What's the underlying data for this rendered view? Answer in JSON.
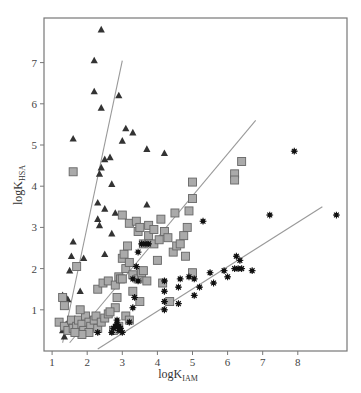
{
  "chart_data": {
    "type": "scatter",
    "title": "",
    "xlabel": "logK_IAM",
    "xlabel_main": "logK",
    "xlabel_sub": "IAM",
    "ylabel": "logK_HSA",
    "ylabel_main": "logK",
    "ylabel_sub": "HSA",
    "xlim": [
      0.5,
      9.4
    ],
    "ylim": [
      0,
      8.0
    ],
    "xticks": [
      1,
      2,
      3,
      4,
      5,
      6,
      7,
      8
    ],
    "yticks": [
      1,
      2,
      3,
      4,
      5,
      6,
      7
    ],
    "grid": false,
    "legend": null,
    "series": [
      {
        "name": "triangles",
        "marker": "triangle",
        "color": "#333333",
        "points": [
          [
            2.4,
            7.8
          ],
          [
            2.2,
            7.05
          ],
          [
            2.2,
            6.3
          ],
          [
            2.4,
            5.9
          ],
          [
            2.9,
            6.2
          ],
          [
            3.1,
            5.4
          ],
          [
            3.3,
            5.3
          ],
          [
            3.0,
            5.1
          ],
          [
            1.6,
            5.15
          ],
          [
            2.5,
            4.65
          ],
          [
            2.65,
            4.7
          ],
          [
            2.4,
            4.45
          ],
          [
            2.35,
            4.3
          ],
          [
            3.7,
            4.9
          ],
          [
            4.2,
            4.8
          ],
          [
            2.7,
            4.05
          ],
          [
            2.3,
            3.6
          ],
          [
            2.5,
            3.45
          ],
          [
            2.8,
            3.35
          ],
          [
            3.7,
            3.55
          ],
          [
            2.3,
            3.2
          ],
          [
            2.35,
            3.05
          ],
          [
            2.7,
            2.85
          ],
          [
            1.6,
            2.65
          ],
          [
            2.5,
            2.35
          ],
          [
            1.55,
            2.3
          ],
          [
            1.9,
            2.25
          ],
          [
            1.5,
            1.95
          ],
          [
            1.3,
            1.35
          ],
          [
            1.4,
            1.3
          ],
          [
            1.45,
            1.25
          ],
          [
            1.8,
            1.45
          ],
          [
            1.5,
            0.75
          ],
          [
            1.4,
            0.65
          ],
          [
            1.7,
            0.7
          ],
          [
            1.3,
            0.5
          ],
          [
            1.35,
            0.35
          ],
          [
            2.1,
            0.75
          ],
          [
            1.45,
            0.55
          ]
        ]
      },
      {
        "name": "squares",
        "marker": "square",
        "color": "#aaaaaa",
        "points": [
          [
            1.6,
            4.35
          ],
          [
            1.7,
            2.05
          ],
          [
            1.3,
            1.3
          ],
          [
            1.35,
            1.1
          ],
          [
            1.2,
            0.7
          ],
          [
            1.35,
            0.6
          ],
          [
            1.45,
            0.5
          ],
          [
            1.55,
            0.75
          ],
          [
            1.6,
            0.55
          ],
          [
            1.7,
            0.6
          ],
          [
            1.75,
            0.75
          ],
          [
            1.85,
            0.65
          ],
          [
            1.9,
            0.5
          ],
          [
            1.95,
            0.85
          ],
          [
            2.05,
            0.7
          ],
          [
            2.1,
            0.6
          ],
          [
            2.2,
            0.75
          ],
          [
            2.25,
            0.85
          ],
          [
            2.3,
            0.55
          ],
          [
            2.4,
            0.7
          ],
          [
            2.5,
            0.8
          ],
          [
            2.6,
            0.9
          ],
          [
            1.8,
            1.0
          ],
          [
            2.3,
            1.5
          ],
          [
            2.45,
            1.65
          ],
          [
            2.6,
            1.7
          ],
          [
            2.8,
            1.6
          ],
          [
            2.85,
            1.3
          ],
          [
            2.8,
            1.05
          ],
          [
            2.9,
            1.8
          ],
          [
            2.95,
            1.75
          ],
          [
            3.0,
            1.75
          ],
          [
            3.1,
            2.0
          ],
          [
            3.0,
            2.25
          ],
          [
            3.05,
            2.35
          ],
          [
            3.15,
            2.55
          ],
          [
            3.2,
            2.15
          ],
          [
            3.3,
            1.85
          ],
          [
            3.45,
            1.75
          ],
          [
            3.55,
            1.9
          ],
          [
            3.6,
            1.95
          ],
          [
            3.7,
            1.7
          ],
          [
            3.0,
            3.3
          ],
          [
            3.2,
            3.1
          ],
          [
            3.4,
            3.15
          ],
          [
            3.45,
            2.9
          ],
          [
            3.6,
            2.6
          ],
          [
            3.75,
            2.8
          ],
          [
            3.9,
            2.6
          ],
          [
            4.1,
            3.2
          ],
          [
            4.2,
            2.9
          ],
          [
            4.3,
            2.75
          ],
          [
            4.45,
            2.4
          ],
          [
            4.55,
            2.55
          ],
          [
            4.65,
            2.6
          ],
          [
            4.75,
            2.8
          ],
          [
            4.85,
            3.0
          ],
          [
            4.9,
            3.4
          ],
          [
            5.0,
            3.7
          ],
          [
            5.0,
            4.1
          ],
          [
            4.8,
            2.3
          ],
          [
            3.5,
            1.2
          ],
          [
            4.35,
            1.2
          ],
          [
            4.15,
            1.65
          ],
          [
            4.0,
            2.2
          ],
          [
            3.3,
            1.45
          ],
          [
            3.1,
            0.85
          ],
          [
            3.2,
            0.75
          ],
          [
            2.9,
            0.6
          ],
          [
            2.75,
            0.5
          ],
          [
            2.65,
            0.95
          ],
          [
            3.5,
            3.0
          ],
          [
            3.75,
            3.05
          ],
          [
            3.9,
            2.95
          ],
          [
            4.05,
            2.7
          ],
          [
            4.5,
            3.35
          ],
          [
            6.2,
            4.3
          ],
          [
            6.2,
            4.15
          ],
          [
            6.4,
            4.6
          ],
          [
            5.0,
            1.9
          ],
          [
            2.05,
            0.45
          ],
          [
            1.85,
            0.4
          ],
          [
            1.65,
            0.45
          ]
        ]
      },
      {
        "name": "asterisks",
        "marker": "asterisk",
        "color": "#111111",
        "points": [
          [
            2.3,
            0.45
          ],
          [
            2.75,
            0.55
          ],
          [
            2.85,
            0.65
          ],
          [
            2.9,
            0.5
          ],
          [
            2.8,
            0.6
          ],
          [
            2.95,
            0.55
          ],
          [
            3.0,
            0.45
          ],
          [
            2.7,
            0.45
          ],
          [
            2.9,
            0.6
          ],
          [
            2.85,
            0.75
          ],
          [
            3.3,
            1.05
          ],
          [
            3.2,
            0.7
          ],
          [
            3.3,
            1.75
          ],
          [
            3.35,
            1.3
          ],
          [
            3.45,
            1.7
          ],
          [
            3.55,
            2.6
          ],
          [
            3.65,
            2.6
          ],
          [
            3.75,
            2.6
          ],
          [
            3.45,
            2.4
          ],
          [
            3.4,
            2.05
          ],
          [
            4.2,
            1.7
          ],
          [
            4.2,
            1.45
          ],
          [
            4.2,
            1.0
          ],
          [
            4.2,
            1.2
          ],
          [
            4.6,
            1.15
          ],
          [
            4.6,
            1.55
          ],
          [
            4.65,
            1.75
          ],
          [
            5.05,
            1.75
          ],
          [
            5.05,
            1.35
          ],
          [
            5.2,
            1.55
          ],
          [
            5.3,
            3.15
          ],
          [
            5.6,
            1.65
          ],
          [
            5.9,
            1.95
          ],
          [
            6.0,
            1.8
          ],
          [
            6.2,
            2.0
          ],
          [
            6.25,
            2.3
          ],
          [
            6.35,
            2.2
          ],
          [
            6.3,
            2.0
          ],
          [
            6.4,
            2.0
          ],
          [
            6.7,
            1.95
          ],
          [
            7.2,
            3.3
          ],
          [
            7.9,
            4.85
          ],
          [
            9.1,
            3.3
          ],
          [
            4.9,
            1.8
          ],
          [
            5.5,
            1.9
          ]
        ]
      }
    ],
    "lines": [
      {
        "name": "fit-triangles",
        "from": [
          1.3,
          0.2
        ],
        "to": [
          3.0,
          7.05
        ],
        "color": "#999999"
      },
      {
        "name": "fit-squares",
        "from": [
          1.5,
          0.2
        ],
        "to": [
          6.8,
          5.6
        ],
        "color": "#999999"
      },
      {
        "name": "fit-asterisks",
        "from": [
          2.3,
          0.05
        ],
        "to": [
          8.7,
          3.5
        ],
        "color": "#999999"
      }
    ],
    "annotations": []
  },
  "plot": {
    "frame": {
      "left": 44,
      "top": 18,
      "right": 347,
      "bottom": 351
    },
    "x_origin_px": 17,
    "x_px_per_unit": 35.1,
    "y_origin_px": 351,
    "y_px_per_unit": 41.2
  }
}
